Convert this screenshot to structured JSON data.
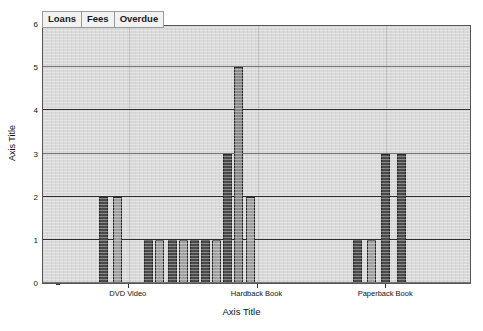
{
  "chart_data": {
    "type": "bar",
    "title": "",
    "xlabel": "Axis Title",
    "ylabel": "Axis Title",
    "ylim": [
      0,
      6
    ],
    "yticks": [
      0,
      1,
      2,
      3,
      4,
      5,
      6
    ],
    "grid": true,
    "legend_position": "top-left",
    "legend": [
      "Loans",
      "Fees",
      "Overdue"
    ],
    "categories": [
      "DVD Video",
      "Hardback Book",
      "Paperback Book"
    ],
    "category_tick_positions_pct": [
      20.0,
      50.0,
      80.0
    ],
    "series": [
      {
        "name": "Loans",
        "color": "#4a4a4a",
        "bars": [
          {
            "x_pct": 28.5,
            "value": 2
          },
          {
            "x_pct": 47.0,
            "value": 1
          },
          {
            "x_pct": 54.5,
            "value": 1
          },
          {
            "x_pct": 64.0,
            "value": 1
          },
          {
            "x_pct": 72.0,
            "value": 1
          },
          {
            "x_pct": 79.5,
            "value": 3
          },
          {
            "x_pct": 132.0,
            "value": 1
          },
          {
            "x_pct": 145.0,
            "value": 3
          }
        ]
      },
      {
        "name": "Fees",
        "color": "#a0a0a0",
        "bars": [
          {
            "x_pct": 35.0,
            "value": 2
          },
          {
            "x_pct": 50.5,
            "value": 1
          },
          {
            "x_pct": 58.5,
            "value": 1
          },
          {
            "x_pct": 68.0,
            "value": 1
          },
          {
            "x_pct": 76.0,
            "value": 1
          },
          {
            "x_pct": 84.5,
            "value": 5
          },
          {
            "x_pct": 138.0,
            "value": 1
          },
          {
            "x_pct": 150.0,
            "value": 3
          }
        ]
      },
      {
        "name": "Overdue",
        "color": "#8a8a8a",
        "bars": [
          {
            "x_pct": 88.5,
            "value": 2
          }
        ]
      }
    ],
    "bars_rendered": [
      {
        "x_pct": 23.6,
        "value": 2,
        "color": "#4a4a4a"
      },
      {
        "x_pct": 29.6,
        "value": 2,
        "color": "#a0a0a0"
      },
      {
        "x_pct": 42.4,
        "value": 1,
        "color": "#4a4a4a"
      },
      {
        "x_pct": 47.0,
        "value": 1,
        "color": "#a0a0a0"
      },
      {
        "x_pct": 52.3,
        "value": 1,
        "color": "#4a4a4a"
      },
      {
        "x_pct": 57.0,
        "value": 1,
        "color": "#a0a0a0"
      },
      {
        "x_pct": 61.6,
        "value": 1,
        "color": "#4a4a4a"
      },
      {
        "x_pct": 66.3,
        "value": 1,
        "color": "#4a4a4a"
      },
      {
        "x_pct": 70.9,
        "value": 1,
        "color": "#a0a0a0"
      },
      {
        "x_pct": 75.7,
        "value": 3,
        "color": "#4a4a4a"
      },
      {
        "x_pct": 80.4,
        "value": 5,
        "color": "#8a8a8a"
      },
      {
        "x_pct": 85.2,
        "value": 2,
        "color": "#a0a0a0"
      },
      {
        "x_pct": 130.0,
        "value": 1,
        "color": "#4a4a4a"
      },
      {
        "x_pct": 136.0,
        "value": 1,
        "color": "#a0a0a0"
      },
      {
        "x_pct": 142.0,
        "value": 3,
        "color": "#4a4a4a"
      },
      {
        "x_pct": 148.5,
        "value": 3,
        "color": "#4a4a4a"
      }
    ],
    "colors": {
      "series_dark": "#4a4a4a",
      "series_mid": "#a0a0a0",
      "series_light": "#8a8a8a",
      "plot_background": "#d9d9d9",
      "gridline": "#2f2f2f",
      "axis": "#333333",
      "text": "#111111"
    }
  }
}
